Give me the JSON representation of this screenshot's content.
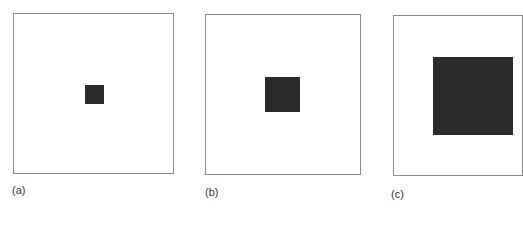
{
  "figure": {
    "panels": [
      {
        "label": "(a)",
        "square_size": "small"
      },
      {
        "label": "(b)",
        "square_size": "medium"
      },
      {
        "label": "(c)",
        "square_size": "large"
      }
    ],
    "colors": {
      "frame": "#8a8a8a",
      "square": "#2b2b2b",
      "background": "#ffffff"
    }
  }
}
